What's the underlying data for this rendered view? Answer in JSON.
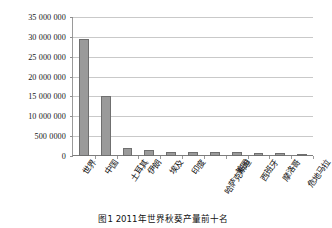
{
  "chart_data": {
    "type": "bar",
    "title": "",
    "caption": "图1  2011年世界秋葵产量前十名",
    "xlabel": "",
    "ylabel": "",
    "ylim": [
      0,
      35000000
    ],
    "grid": true,
    "legend": "none",
    "ytick_labels": [
      "35 000 000",
      "30 000 000",
      "25 000 000",
      "20 000 000",
      "15 000 000",
      "10 000 000",
      "500 0000",
      "0"
    ],
    "ytick_values": [
      35000000,
      30000000,
      25000000,
      20000000,
      15000000,
      10000000,
      5000000,
      0
    ],
    "categories": [
      "世界",
      "中国",
      "土耳其",
      "伊朗",
      "埃及",
      "印度",
      "哈萨克斯坦",
      "美国",
      "西班牙",
      "摩洛哥",
      "危地马拉"
    ],
    "values": [
      29500000,
      15000000,
      2000000,
      1500000,
      1000000,
      1100000,
      900000,
      900000,
      800000,
      700000,
      500000
    ],
    "bar_color": "#9a9a9a",
    "bar_border_color": "#6f6f6f",
    "grid_color": "#c9c9c9",
    "axis_color": "#7d7d7d"
  }
}
